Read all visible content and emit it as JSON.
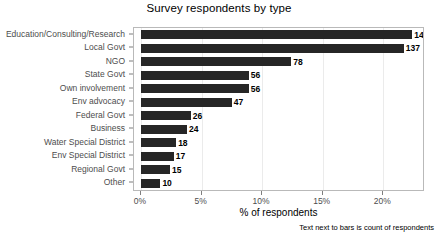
{
  "chart_data": {
    "type": "bar",
    "orientation": "horizontal",
    "title": "Survey respondents by type",
    "xlabel": "% of respondents",
    "ylabel": "",
    "caption": "Text next to bars is count of respondents",
    "categories": [
      "Education/Consulting/Research",
      "Local Govt",
      "NGO",
      "State Govt",
      "Own involvement",
      "Env advocacy",
      "Federal Govt",
      "Business",
      "Water Special District",
      "Env Special District",
      "Regional Govt",
      "Other"
    ],
    "values": [
      22.4,
      21.7,
      12.4,
      8.9,
      8.9,
      7.5,
      4.1,
      3.8,
      2.9,
      2.7,
      2.4,
      1.6
    ],
    "counts": [
      141,
      137,
      78,
      56,
      56,
      47,
      26,
      24,
      18,
      17,
      15,
      10
    ],
    "count_labels": [
      "141",
      "137",
      "78",
      "56",
      "56",
      "47",
      "26",
      "24",
      "18",
      "17",
      "15",
      "10"
    ],
    "xlim": [
      0,
      23.2
    ],
    "xticks": [
      0,
      5,
      10,
      15,
      20
    ],
    "xtick_labels": [
      "0%",
      "5%",
      "10%",
      "15%",
      "20%"
    ],
    "grid": true,
    "legend": false,
    "bar_color": "#262626",
    "panel_border_color": "#b9b9b9",
    "gridline_color": "#ebebeb",
    "axis_text_color": "#4d4d4d"
  }
}
